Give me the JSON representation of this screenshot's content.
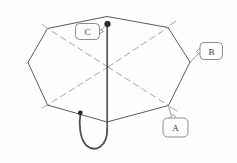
{
  "figure": {
    "background_color": "#fefefe",
    "line_color": "#5a5a5f",
    "dashed_rib_color": "#9a9a9e",
    "label_box_stroke": "#8d8d92",
    "label_box_fill": "#fdfdfd",
    "label_text_color": "#3a3a3a",
    "marker_color": "#2b2b2b"
  },
  "labels": [
    {
      "id": "A",
      "text": "A",
      "points_to": "lower-right-rib-tip"
    },
    {
      "id": "B",
      "text": "B",
      "points_to": "right-rib-tip"
    },
    {
      "id": "C",
      "text": "C",
      "points_to": "finial-top-of-pole"
    }
  ],
  "parts": {
    "canopy": "heptagonal-canopy-outline",
    "pole": "center-pole",
    "handle": "hook-handle",
    "ribs": "dashed-internal-ribs",
    "finial": "finial-dot",
    "handle_tip": "handle-tip-dot"
  }
}
